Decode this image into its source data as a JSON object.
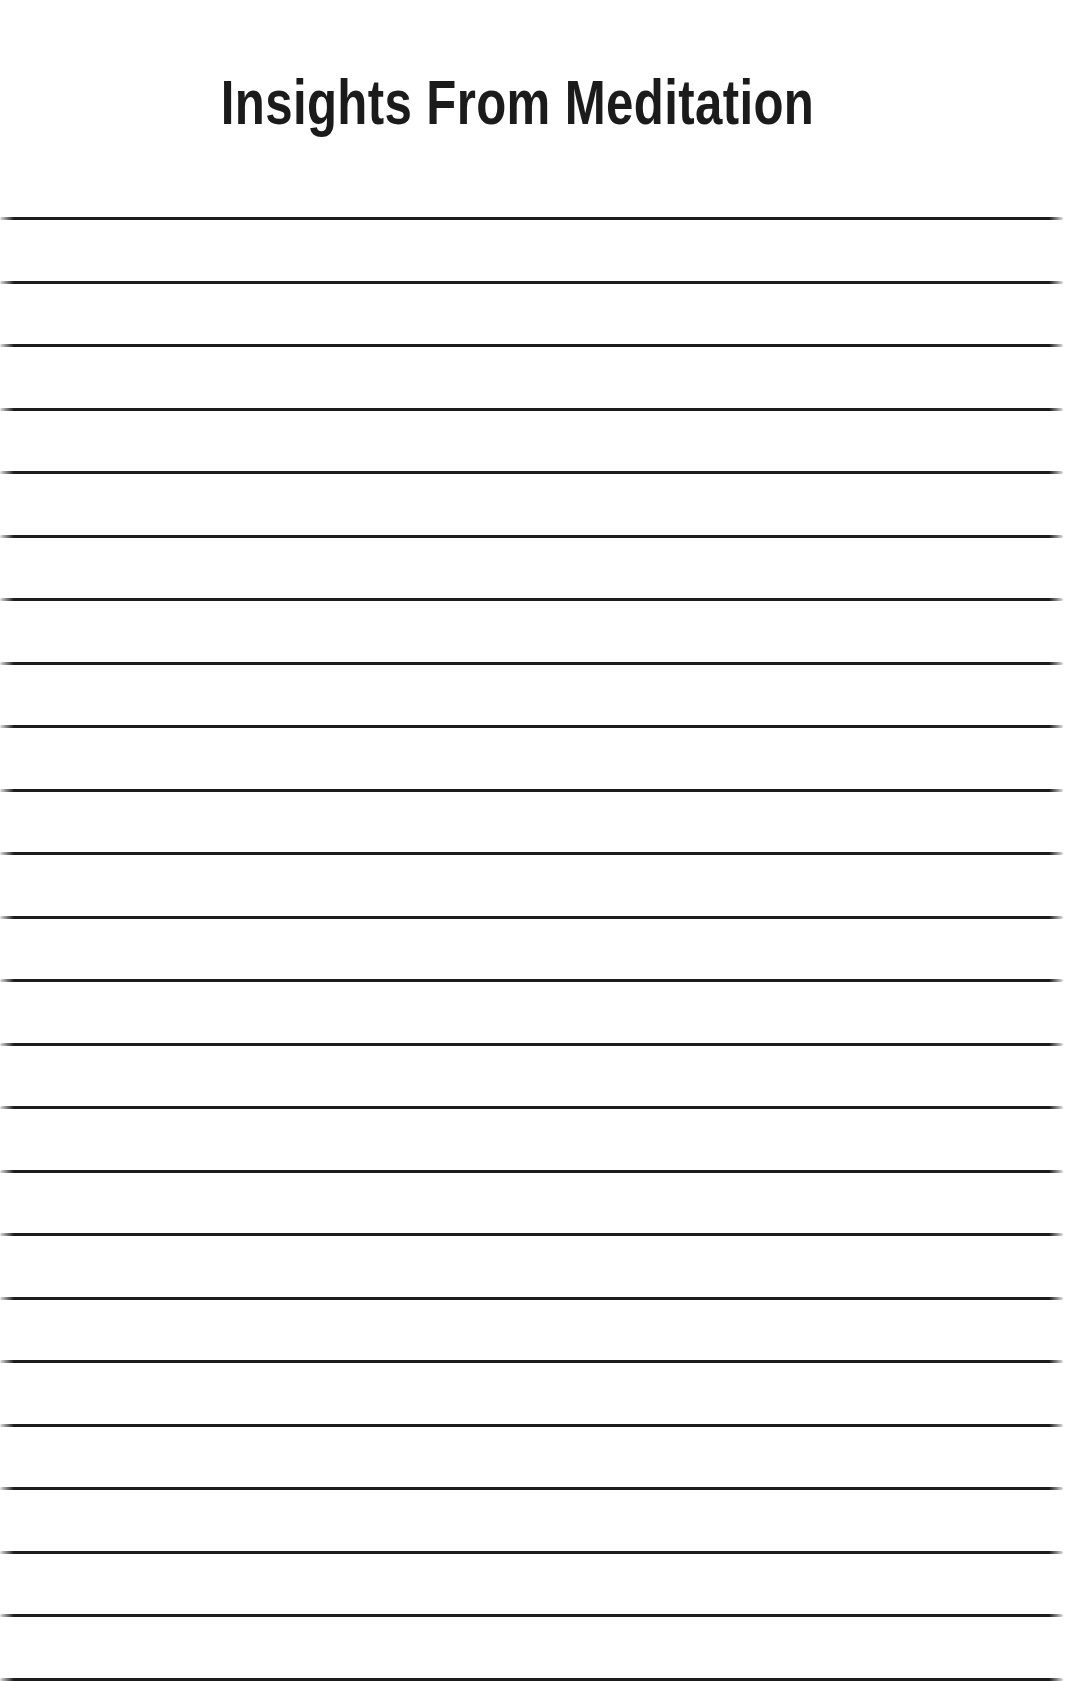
{
  "page": {
    "background_color": "#ffffff",
    "width": 1067,
    "height": 1681,
    "type": "lined-note-page"
  },
  "header": {
    "title": "Insights From Meditation",
    "title_color": "#1b1b1b",
    "title_align": "center"
  },
  "body": {
    "kind": "ruled-writing-area",
    "line_color": "#1c1c1c",
    "line_count": 24,
    "first_line_y": 217,
    "line_spacing": 63.5,
    "line_left": 0,
    "line_width": 1063,
    "line_thickness": 3,
    "lines": [
      {
        "index": 1,
        "text": ""
      },
      {
        "index": 2,
        "text": ""
      },
      {
        "index": 3,
        "text": ""
      },
      {
        "index": 4,
        "text": ""
      },
      {
        "index": 5,
        "text": ""
      },
      {
        "index": 6,
        "text": ""
      },
      {
        "index": 7,
        "text": ""
      },
      {
        "index": 8,
        "text": ""
      },
      {
        "index": 9,
        "text": ""
      },
      {
        "index": 10,
        "text": ""
      },
      {
        "index": 11,
        "text": ""
      },
      {
        "index": 12,
        "text": ""
      },
      {
        "index": 13,
        "text": ""
      },
      {
        "index": 14,
        "text": ""
      },
      {
        "index": 15,
        "text": ""
      },
      {
        "index": 16,
        "text": ""
      },
      {
        "index": 17,
        "text": ""
      },
      {
        "index": 18,
        "text": ""
      },
      {
        "index": 19,
        "text": ""
      },
      {
        "index": 20,
        "text": ""
      },
      {
        "index": 21,
        "text": ""
      },
      {
        "index": 22,
        "text": ""
      },
      {
        "index": 23,
        "text": ""
      },
      {
        "index": 24,
        "text": ""
      }
    ]
  }
}
